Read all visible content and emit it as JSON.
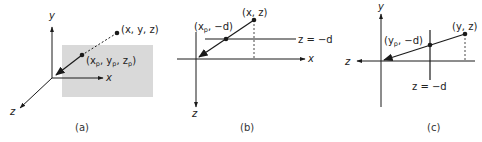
{
  "figure": {
    "panels": [
      {
        "id": "a",
        "caption": "(a)",
        "axes": {
          "y": "y",
          "x": "x",
          "z": "z"
        },
        "point_label_main": "(x, y, z)",
        "point_label_proj": {
          "open": "(x",
          "sub1": "p",
          "mid1": ", y",
          "sub2": "p",
          "mid2": ", z",
          "sub3": "p",
          "close": ")"
        },
        "plane_color": "#d9d9d9"
      },
      {
        "id": "b",
        "caption": "(b)",
        "axes": {
          "x": "x",
          "z": "z"
        },
        "point_label_main": "(x, z)",
        "point_label_proj": {
          "open": "(x",
          "sub": "p",
          "rest": ", −d)"
        },
        "plane_label": "z = −d"
      },
      {
        "id": "c",
        "caption": "(c)",
        "axes": {
          "y": "y",
          "z": "z"
        },
        "point_label_main": "(y, z)",
        "point_label_proj": {
          "open": "(y",
          "sub": "p",
          "rest": ", −d)"
        },
        "plane_label": "z = −d"
      }
    ],
    "line_color": "#1a1a1a"
  }
}
